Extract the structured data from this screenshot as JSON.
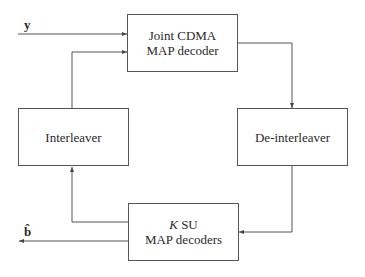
{
  "blocks": {
    "joint": {
      "line1": "Joint CDMA",
      "line2": "MAP decoder"
    },
    "interleaver": {
      "label": "Interleaver"
    },
    "deinterleaver": {
      "label": "De-interleaver"
    },
    "su": {
      "var": "K",
      "line1_rest": " SU",
      "line2": "MAP decoders"
    }
  },
  "signals": {
    "input": "y",
    "output": "b̂"
  },
  "colors": {
    "line": "#555555",
    "text": "#2a2a2a"
  }
}
